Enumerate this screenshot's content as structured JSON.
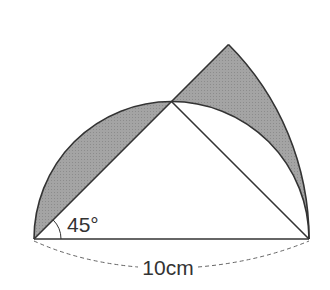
{
  "diagram": {
    "type": "geometry",
    "angle_label": "45°",
    "length_label": "10cm",
    "colors": {
      "shade": "#9a9a9a",
      "stroke": "#333333",
      "dashed": "#666666"
    }
  }
}
